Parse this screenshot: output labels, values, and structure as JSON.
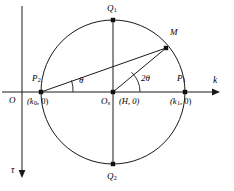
{
  "figure": {
    "type": "geometry-diagram",
    "axes": {
      "horizontal": {
        "name": "k",
        "label": "k",
        "arrow": "right"
      },
      "vertical": {
        "name": "tau",
        "label": "τ",
        "arrow": "down"
      },
      "origin": {
        "label": "O"
      }
    },
    "points": [
      {
        "id": "O",
        "label": "O",
        "sub": "",
        "coord": "",
        "x": 22,
        "y": 92,
        "dot": false
      },
      {
        "id": "P2",
        "label": "P",
        "sub": "2",
        "coord": "(k₀, 0)",
        "coord_main": "(k",
        "coord_sub": "0",
        "coord_tail": ", 0)",
        "x": 41,
        "y": 92,
        "dot": true
      },
      {
        "id": "Os",
        "label": "O",
        "sub": "s",
        "coord": "(H, 0)",
        "x": 113,
        "y": 92,
        "dot": true
      },
      {
        "id": "P1",
        "label": "P",
        "sub": "1",
        "coord": "(k₁, 0)",
        "coord_main": "(k",
        "coord_sub": "1",
        "coord_tail": ", 0)",
        "x": 185,
        "y": 92,
        "dot": true
      },
      {
        "id": "Q1",
        "label": "Q",
        "sub": "1",
        "coord": "",
        "x": 113,
        "y": 20,
        "dot": true
      },
      {
        "id": "Q2",
        "label": "Q",
        "sub": "2",
        "coord": "",
        "x": 113,
        "y": 164,
        "dot": true
      },
      {
        "id": "M",
        "label": "M",
        "sub": "",
        "coord": "",
        "x": 166,
        "y": 48,
        "dot": true
      }
    ],
    "angles": [
      {
        "id": "theta",
        "label": "θ",
        "vertex": "P2",
        "between": [
          "k-axis",
          "P2M"
        ]
      },
      {
        "id": "two-theta",
        "label": "2θ",
        "vertex": "Os",
        "between": [
          "k-axis",
          "OsM"
        ]
      }
    ],
    "circle": {
      "center": "Os",
      "cx": 113,
      "cy": 92,
      "r": 72
    },
    "segments": [
      {
        "from": "P2",
        "to": "M",
        "name": "chord-p2-m"
      },
      {
        "from": "Os",
        "to": "M",
        "name": "radius-os-m"
      },
      {
        "from": "Q1",
        "to": "Q2",
        "name": "vertical-diameter"
      },
      {
        "from": "P2",
        "to": "P1",
        "name": "horizontal-diameter"
      }
    ],
    "colors": {
      "stroke": "#1a1a1a",
      "background": "#ffffff",
      "text": "#000000"
    }
  }
}
